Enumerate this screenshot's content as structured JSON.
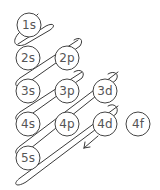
{
  "diagram": {
    "orbitals": [
      {
        "label": "1s",
        "cx": 29,
        "cy": 25
      },
      {
        "label": "2s",
        "cx": 28,
        "cy": 58
      },
      {
        "label": "2p",
        "cx": 67,
        "cy": 58
      },
      {
        "label": "3s",
        "cx": 28,
        "cy": 91
      },
      {
        "label": "3p",
        "cx": 67,
        "cy": 91
      },
      {
        "label": "3d",
        "cx": 105,
        "cy": 91
      },
      {
        "label": "4s",
        "cx": 28,
        "cy": 124
      },
      {
        "label": "4p",
        "cx": 67,
        "cy": 124
      },
      {
        "label": "4d",
        "cx": 105,
        "cy": 124
      },
      {
        "label": "4f",
        "cx": 138,
        "cy": 124
      },
      {
        "label": "5s",
        "cx": 28,
        "cy": 158
      }
    ],
    "arrow_direction": "down-left",
    "colors": {
      "stroke": "#3a3a3a",
      "text": "#555555",
      "background": "#ffffff"
    }
  }
}
